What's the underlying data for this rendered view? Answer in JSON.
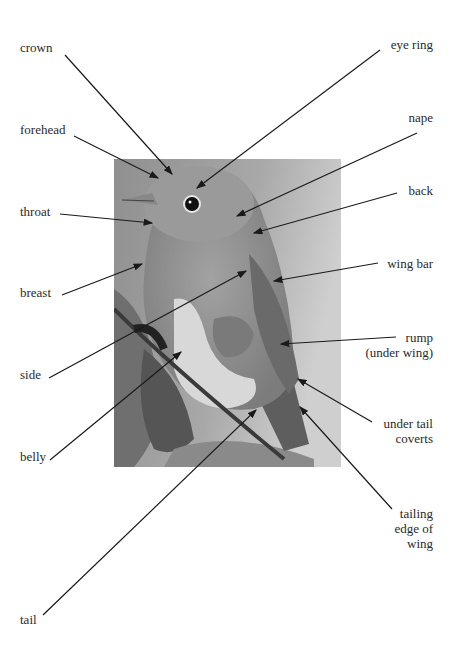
{
  "diagram": {
    "photo_alt": "grayscale photo of a robin perched on a branch",
    "labels_left": [
      {
        "id": "crown",
        "text": "crown",
        "x": 20,
        "y": 40,
        "tip": [
          172,
          176
        ]
      },
      {
        "id": "forehead",
        "text": "forehead",
        "x": 20,
        "y": 123,
        "tip": [
          160,
          180
        ]
      },
      {
        "id": "throat",
        "text": "throat",
        "x": 20,
        "y": 204,
        "tip": [
          153,
          224
        ]
      },
      {
        "id": "breast",
        "text": "breast",
        "x": 20,
        "y": 286,
        "tip": [
          143,
          263
        ]
      },
      {
        "id": "side",
        "text": "side",
        "x": 20,
        "y": 368,
        "tip": [
          247,
          271
        ]
      },
      {
        "id": "belly",
        "text": "belly",
        "x": 20,
        "y": 450,
        "tip": [
          182,
          351
        ]
      },
      {
        "id": "tail",
        "text": "tail",
        "x": 20,
        "y": 612,
        "tip": [
          257,
          410
        ]
      }
    ],
    "labels_right": [
      {
        "id": "eye-ring",
        "text": "eye ring",
        "x": 431,
        "y": 38,
        "tip": [
          196,
          189
        ]
      },
      {
        "id": "nape",
        "text": "nape",
        "x": 431,
        "y": 111,
        "tip": [
          236,
          217
        ]
      },
      {
        "id": "back",
        "text": "back",
        "x": 431,
        "y": 184,
        "tip": [
          253,
          233
        ]
      },
      {
        "id": "wing-bar",
        "text": "wing bar",
        "x": 431,
        "y": 257,
        "tip": [
          273,
          281
        ]
      },
      {
        "id": "rump",
        "text": "rump\n(under wing)",
        "lines": [
          "rump",
          "(under wing)"
        ],
        "x": 431,
        "y": 330,
        "tip": [
          280,
          344
        ]
      },
      {
        "id": "under-tail-coverts",
        "lines": [
          "under tail",
          "coverts"
        ],
        "x": 431,
        "y": 416,
        "tip": [
          297,
          379
        ]
      },
      {
        "id": "trailing-edge",
        "lines": [
          "tailing",
          "edge of",
          "wing"
        ],
        "x": 431,
        "y": 505,
        "tip": [
          299,
          407
        ]
      }
    ]
  }
}
